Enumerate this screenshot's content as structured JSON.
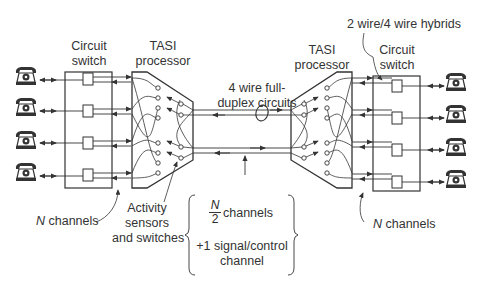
{
  "diagram": {
    "type": "TASI system block diagram",
    "left": {
      "circuit_switch_label": [
        "Circuit",
        "switch"
      ],
      "tasi_label": [
        "TASI",
        "processor"
      ],
      "channels_label_prefix": "N",
      "channels_label_suffix": " channels",
      "activity_label": [
        "Activity",
        "sensors",
        "and switches"
      ],
      "telephones": 4
    },
    "right": {
      "circuit_switch_label": [
        "Circuit",
        "switch"
      ],
      "tasi_label": [
        "TASI",
        "processor"
      ],
      "hybrids_label": "2 wire/4 wire hybrids",
      "channels_label_prefix": "N",
      "channels_label_suffix": " channels",
      "telephones": 4
    },
    "link": {
      "label": [
        "4 wire full-",
        "duplex circuits"
      ]
    },
    "brace": {
      "fraction_num": "N",
      "fraction_den": "2",
      "line1_suffix": " channels",
      "line2": "+1 signal/control",
      "line3": "channel"
    },
    "colors": {
      "line": "#333333",
      "background": "#ffffff"
    }
  }
}
